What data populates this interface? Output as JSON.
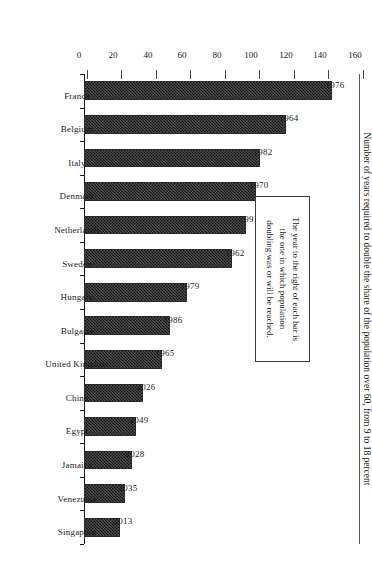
{
  "chart_data": {
    "type": "bar",
    "title": "",
    "subtitle": "",
    "xlabel": "",
    "ylabel": "Number of years required to double the share of the population over 60, from 9 to 18 percent",
    "ylim": [
      0,
      160
    ],
    "ytick_labels": [
      "0",
      "20",
      "40",
      "60",
      "80",
      "100",
      "120",
      "140",
      "160"
    ],
    "ytick_values": [
      0,
      20,
      40,
      60,
      80,
      100,
      120,
      140,
      160
    ],
    "grid": false,
    "legend": "none",
    "orientation": "horizontal-rotated",
    "bar_value_label_note": "Year printed beside each bar",
    "categories": [
      "France",
      "Belgium",
      "Italy",
      "Denmark",
      "Netherlands",
      "Sweden",
      "Hungary",
      "Bulgaria",
      "United Kingdom",
      "China",
      "Egypt",
      "Jamaica",
      "Venezuela",
      "Singapore"
    ],
    "values": [
      144,
      117,
      102,
      100,
      94,
      86,
      60,
      50,
      45,
      34,
      30,
      28,
      24,
      21
    ],
    "point_labels": [
      "1976",
      "1964",
      "1982",
      "1970",
      "1991",
      "1962",
      "1979",
      "1986",
      "1965",
      "2026",
      "2049",
      "2028",
      "2035",
      "2013"
    ],
    "bars": [
      {
        "category": "France",
        "value": 144,
        "label": "1976"
      },
      {
        "category": "Belgium",
        "value": 117,
        "label": "1964"
      },
      {
        "category": "Italy",
        "value": 102,
        "label": "1982"
      },
      {
        "category": "Denmark",
        "value": 100,
        "label": "1970"
      },
      {
        "category": "Netherlands",
        "value": 94,
        "label": "1991"
      },
      {
        "category": "Sweden",
        "value": 86,
        "label": "1962"
      },
      {
        "category": "Hungary",
        "value": 60,
        "label": "1979"
      },
      {
        "category": "Bulgaria",
        "value": 50,
        "label": "1986"
      },
      {
        "category": "United Kingdom",
        "value": 45,
        "label": "1965"
      },
      {
        "category": "China",
        "value": 34,
        "label": "2026"
      },
      {
        "category": "Egypt",
        "value": 30,
        "label": "2049"
      },
      {
        "category": "Jamaica",
        "value": 28,
        "label": "2028"
      },
      {
        "category": "Venezuela",
        "value": 24,
        "label": "2035"
      },
      {
        "category": "Singapore",
        "value": 21,
        "label": "2013"
      }
    ],
    "annotation": "The year to the right of each bar is the one in which population doubling was or will be reached.",
    "annotation_lines": [
      "The year to the right of each bar is",
      "the one in which population",
      "doubling was or will be reached."
    ],
    "colors": {
      "bar_fill": "#4a4a4a",
      "bar_hatch": "#111111",
      "bar_border": "#2b2b2b",
      "axis": "#1a1a1a",
      "text": "#1a1a1a",
      "background": "#ffffff"
    }
  }
}
